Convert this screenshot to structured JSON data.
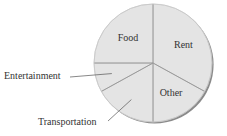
{
  "chart_data": {
    "type": "pie",
    "title": "",
    "start": "top",
    "direction": "clockwise",
    "slices": [
      {
        "label": "Rent",
        "value": 33,
        "label_position": "inside"
      },
      {
        "label": "Other",
        "value": 17,
        "label_position": "inside"
      },
      {
        "label": "Transportation",
        "value": 17,
        "label_position": "outside-bottom-left"
      },
      {
        "label": "Entertainment",
        "value": 8,
        "label_position": "outside-left"
      },
      {
        "label": "Food",
        "value": 25,
        "label_position": "inside"
      }
    ],
    "unit": "percent",
    "legend": "none"
  },
  "colors": {
    "fill": "#e4e4e4",
    "divider": "#9a9a9a",
    "outline": "#c8c8c8",
    "shadow": "#8a8a8a",
    "text": "#333333",
    "leader": "#555555"
  }
}
